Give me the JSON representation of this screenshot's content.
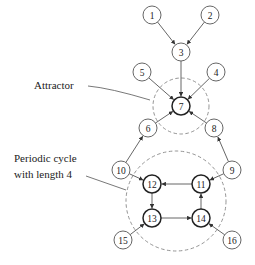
{
  "diagram": {
    "type": "state-transition-graph",
    "labels": {
      "attractor": "Attractor",
      "cycle_line1": "Periodic cycle",
      "cycle_line2": "with length 4"
    },
    "nodes": [
      {
        "id": "1",
        "label": "1",
        "x": 152,
        "y": 15,
        "bold": false
      },
      {
        "id": "2",
        "label": "2",
        "x": 210,
        "y": 15,
        "bold": false
      },
      {
        "id": "3",
        "label": "3",
        "x": 181,
        "y": 52,
        "bold": false
      },
      {
        "id": "4",
        "label": "4",
        "x": 216,
        "y": 72,
        "bold": false
      },
      {
        "id": "5",
        "label": "5",
        "x": 142,
        "y": 72,
        "bold": false
      },
      {
        "id": "6",
        "label": "6",
        "x": 148,
        "y": 128,
        "bold": false
      },
      {
        "id": "7",
        "label": "7",
        "x": 181,
        "y": 106,
        "bold": true
      },
      {
        "id": "8",
        "label": "8",
        "x": 214,
        "y": 128,
        "bold": false
      },
      {
        "id": "9",
        "label": "9",
        "x": 232,
        "y": 170,
        "bold": false
      },
      {
        "id": "10",
        "label": "10",
        "x": 121,
        "y": 170,
        "bold": false
      },
      {
        "id": "11",
        "label": "11",
        "x": 201,
        "y": 184,
        "bold": true
      },
      {
        "id": "12",
        "label": "12",
        "x": 152,
        "y": 184,
        "bold": true
      },
      {
        "id": "13",
        "label": "13",
        "x": 152,
        "y": 218,
        "bold": true
      },
      {
        "id": "14",
        "label": "14",
        "x": 201,
        "y": 218,
        "bold": true
      },
      {
        "id": "15",
        "label": "15",
        "x": 123,
        "y": 240,
        "bold": false
      },
      {
        "id": "16",
        "label": "16",
        "x": 232,
        "y": 240,
        "bold": false
      }
    ],
    "edges": [
      {
        "from": "1",
        "to": "3"
      },
      {
        "from": "2",
        "to": "3"
      },
      {
        "from": "3",
        "to": "7"
      },
      {
        "from": "5",
        "to": "7"
      },
      {
        "from": "4",
        "to": "7"
      },
      {
        "from": "6",
        "to": "7"
      },
      {
        "from": "8",
        "to": "7"
      },
      {
        "from": "10",
        "to": "6"
      },
      {
        "from": "9",
        "to": "8"
      },
      {
        "from": "10",
        "to": "12"
      },
      {
        "from": "9",
        "to": "11"
      },
      {
        "from": "11",
        "to": "12"
      },
      {
        "from": "12",
        "to": "13"
      },
      {
        "from": "13",
        "to": "14"
      },
      {
        "from": "14",
        "to": "11"
      },
      {
        "from": "15",
        "to": "13"
      },
      {
        "from": "16",
        "to": "14"
      }
    ],
    "regions": [
      {
        "name": "attractor-region",
        "cx": 181,
        "cy": 106,
        "r": 28
      },
      {
        "name": "periodic-cycle-region",
        "cx": 176,
        "cy": 201,
        "r": 50
      }
    ]
  }
}
